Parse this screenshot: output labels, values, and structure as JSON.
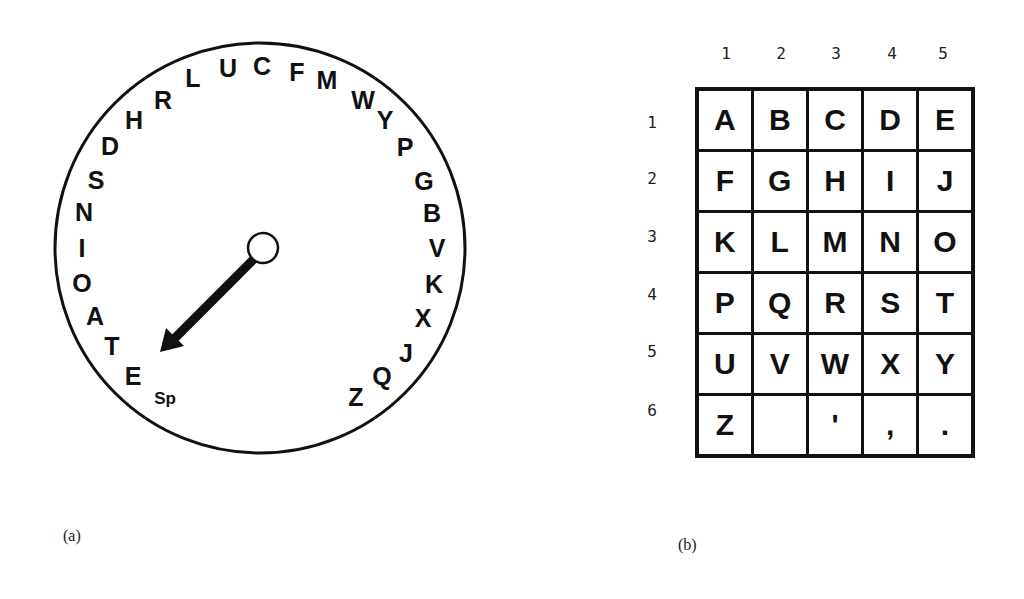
{
  "panel_a": {
    "caption": "(a)",
    "wheel": {
      "center": [
        260,
        248
      ],
      "radius": 205,
      "hub_radius": 15,
      "pointer_tip": [
        160,
        352
      ],
      "letters": [
        {
          "label": "L",
          "x": 193,
          "y": 78
        },
        {
          "label": "U",
          "x": 228,
          "y": 68
        },
        {
          "label": "C",
          "x": 262,
          "y": 66
        },
        {
          "label": "F",
          "x": 297,
          "y": 72
        },
        {
          "label": "M",
          "x": 327,
          "y": 80
        },
        {
          "label": "W",
          "x": 363,
          "y": 100
        },
        {
          "label": "Y",
          "x": 385,
          "y": 120
        },
        {
          "label": "P",
          "x": 405,
          "y": 147
        },
        {
          "label": "G",
          "x": 424,
          "y": 181
        },
        {
          "label": "B",
          "x": 432,
          "y": 213
        },
        {
          "label": "V",
          "x": 437,
          "y": 248
        },
        {
          "label": "K",
          "x": 434,
          "y": 284
        },
        {
          "label": "X",
          "x": 423,
          "y": 318
        },
        {
          "label": "J",
          "x": 406,
          "y": 353
        },
        {
          "label": "Q",
          "x": 382,
          "y": 376
        },
        {
          "label": "Z",
          "x": 356,
          "y": 397
        },
        {
          "label": "Sp",
          "x": 165,
          "y": 398,
          "small": true
        },
        {
          "label": "E",
          "x": 133,
          "y": 376
        },
        {
          "label": "T",
          "x": 112,
          "y": 346
        },
        {
          "label": "A",
          "x": 95,
          "y": 316
        },
        {
          "label": "O",
          "x": 82,
          "y": 283
        },
        {
          "label": "I",
          "x": 82,
          "y": 248
        },
        {
          "label": "N",
          "x": 84,
          "y": 212
        },
        {
          "label": "S",
          "x": 96,
          "y": 180
        },
        {
          "label": "D",
          "x": 110,
          "y": 146
        },
        {
          "label": "H",
          "x": 134,
          "y": 120
        },
        {
          "label": "R",
          "x": 163,
          "y": 100
        }
      ]
    }
  },
  "panel_b": {
    "caption": "(b)",
    "column_headers": [
      "1",
      "2",
      "3",
      "4",
      "5"
    ],
    "column_header_x": [
      726,
      781,
      836,
      892,
      943
    ],
    "column_header_y": 53,
    "row_headers": [
      "1",
      "2",
      "3",
      "4",
      "5",
      "6"
    ],
    "row_header_x": 652,
    "row_header_y": [
      122,
      178,
      236,
      294,
      351,
      410
    ],
    "grid": [
      [
        "A",
        "B",
        "C",
        "D",
        "E"
      ],
      [
        "F",
        "G",
        "H",
        "I",
        "J"
      ],
      [
        "K",
        "L",
        "M",
        "N",
        "O"
      ],
      [
        "P",
        "Q",
        "R",
        "S",
        "T"
      ],
      [
        "U",
        "V",
        "W",
        "X",
        "Y"
      ],
      [
        "Z",
        "",
        "'",
        ",",
        "."
      ]
    ]
  }
}
